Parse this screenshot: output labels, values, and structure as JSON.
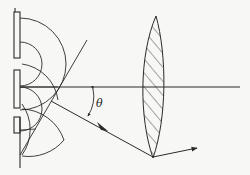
{
  "figure": {
    "labels": {
      "angle": "θ"
    },
    "colors": {
      "background": "#f7f7f5",
      "stroke": "#2a2a2a",
      "hatch": "#3a3a3a"
    },
    "elements": [
      "grating-plates",
      "wavefront-arcs",
      "optical-axis",
      "diffracted-wavefront-line",
      "diffracted-ray",
      "angle-arc",
      "converging-lens",
      "refracted-ray"
    ]
  }
}
